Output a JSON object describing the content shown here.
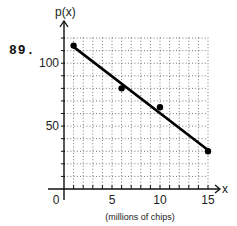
{
  "problem": {
    "number": "89."
  },
  "chart_data": {
    "type": "scatter",
    "title": "",
    "xlabel": "(millions of chips)",
    "ylabel": "p(x)",
    "x_axis_symbol": "x",
    "xlim": [
      0,
      15
    ],
    "ylim": [
      0,
      120
    ],
    "x_ticks": [
      0,
      5,
      10,
      15
    ],
    "x_tick_labels": [
      "0",
      "5",
      "10",
      "15"
    ],
    "y_ticks": [
      50,
      100
    ],
    "y_tick_labels": [
      "50",
      "100"
    ],
    "grid": true,
    "grid_x_step": 1,
    "grid_y_step": 10,
    "legend": null,
    "series": [
      {
        "name": "data points",
        "type": "scatter",
        "x": [
          1,
          6,
          10,
          15
        ],
        "y": [
          114,
          80,
          65,
          30
        ]
      },
      {
        "name": "fitted line",
        "type": "line",
        "x": [
          1,
          15
        ],
        "y": [
          113,
          31
        ]
      }
    ]
  }
}
